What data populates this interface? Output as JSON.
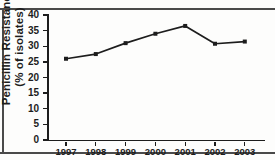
{
  "figure": {
    "y_axis_label_line1": "Penicillin Resistance",
    "y_axis_label_line2": "(% of isolates)"
  },
  "chart_data": {
    "type": "line",
    "title": "",
    "xlabel": "",
    "ylabel": "Penicillin Resistance (% of isolates)",
    "categories": [
      "1997",
      "1998",
      "1999",
      "2000",
      "2001",
      "2002",
      "2003"
    ],
    "values": [
      26,
      27.5,
      31,
      34,
      36.5,
      30.8,
      31.5
    ],
    "series": [
      {
        "name": "Penicillin Resistance",
        "values": [
          26,
          27.5,
          31,
          34,
          36.5,
          30.8,
          31.5
        ]
      }
    ],
    "ylim": [
      0,
      40
    ],
    "y_ticks": [
      0,
      5,
      10,
      15,
      20,
      25,
      30,
      35,
      40
    ],
    "y_tick_labels": [
      "0",
      "5",
      "10",
      "15",
      "20",
      "25",
      "30",
      "35",
      "40"
    ],
    "x_tick_labels": [
      "1997",
      "1998",
      "1999",
      "2000",
      "2001",
      "2002",
      "2003"
    ],
    "grid": false,
    "legend": null,
    "marker": "square",
    "line_color": "#1d1d1d",
    "marker_color": "#1d1d1d"
  }
}
